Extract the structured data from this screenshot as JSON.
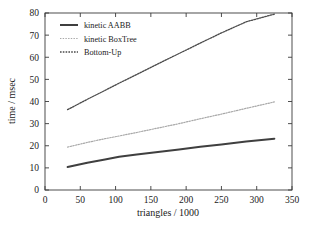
{
  "chart_data": {
    "type": "line",
    "title": "",
    "xlabel": "triangles / 1000",
    "ylabel": "time / msec",
    "xlim": [
      0,
      350
    ],
    "ylim": [
      0,
      80
    ],
    "xticks": [
      0,
      50,
      100,
      150,
      200,
      250,
      300,
      350
    ],
    "yticks": [
      0,
      10,
      20,
      30,
      40,
      50,
      60,
      70,
      80
    ],
    "grid": false,
    "legend_position": "top-left",
    "series": [
      {
        "name": "kinetic AABB",
        "style": "solid-thick",
        "color": "#3f3f3f",
        "x": [
          32,
          60,
          85,
          105,
          130,
          160,
          190,
          220,
          250,
          285,
          325
        ],
        "values": [
          10.4,
          12.3,
          13.8,
          15.0,
          16.0,
          17.2,
          18.3,
          19.5,
          20.6,
          21.9,
          23.2
        ]
      },
      {
        "name": "kinetic BoxTree",
        "style": "dotted-light",
        "color": "#a8a8a8",
        "x": [
          32,
          60,
          85,
          105,
          130,
          160,
          190,
          220,
          250,
          285,
          325
        ],
        "values": [
          19.4,
          21.5,
          23.2,
          24.4,
          26.0,
          28.0,
          30.0,
          32.2,
          34.3,
          36.9,
          39.8
        ]
      },
      {
        "name": "Bottom-Up",
        "style": "dotted-dark",
        "color": "#4a4a4a",
        "x": [
          32,
          60,
          85,
          105,
          130,
          160,
          190,
          220,
          250,
          285,
          325
        ],
        "values": [
          36.3,
          41.0,
          45.0,
          48.3,
          52.2,
          57.0,
          61.7,
          66.4,
          71.0,
          76.0,
          79.5
        ]
      }
    ]
  },
  "legend": {
    "entries": [
      {
        "label": "kinetic AABB"
      },
      {
        "label": "kinetic BoxTree"
      },
      {
        "label": "Bottom-Up"
      }
    ]
  },
  "axes": {
    "x_title": "triangles / 1000",
    "y_title": "time / msec",
    "x_tick_labels": [
      "0",
      "50",
      "100",
      "150",
      "200",
      "250",
      "300",
      "350"
    ],
    "y_tick_labels": [
      "0",
      "10",
      "20",
      "30",
      "40",
      "50",
      "60",
      "70",
      "80"
    ]
  }
}
